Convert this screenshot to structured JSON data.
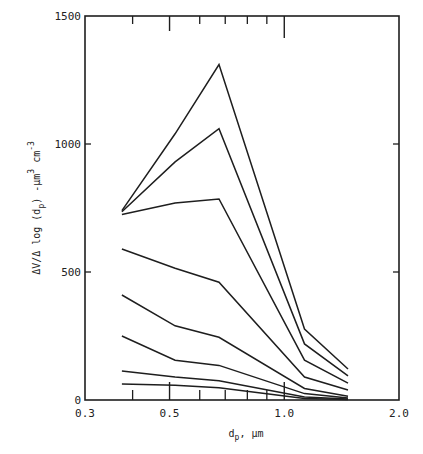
{
  "chart_data": {
    "type": "line",
    "title": "",
    "xlabel": "d_p, μm",
    "ylabel": "ΔV/Δlog(d_p)-μm³cm⁻³",
    "xscale": "log",
    "xlim": [
      0.3,
      2.0
    ],
    "ylim": [
      0,
      1500
    ],
    "x_ticks": [
      0.3,
      0.5,
      1.0,
      2.0
    ],
    "x_tick_labels": [
      "0.3",
      "0.5",
      "1.0",
      "2.0"
    ],
    "x_minor_ticks": [
      0.4,
      0.6,
      0.7,
      0.8,
      0.9
    ],
    "y_ticks": [
      0,
      500,
      1000,
      1500
    ],
    "y_tick_labels": [
      "0",
      "500",
      "1000",
      "1500"
    ],
    "grid": false,
    "legend": null,
    "x": [
      0.375,
      0.517,
      0.674,
      1.13,
      1.47
    ],
    "series": [
      {
        "name": "curve-1",
        "values": [
          740,
          1040,
          1310,
          277,
          121
        ]
      },
      {
        "name": "curve-2",
        "values": [
          735,
          930,
          1060,
          219,
          94
        ]
      },
      {
        "name": "curve-3",
        "values": [
          725,
          770,
          785,
          156,
          66
        ]
      },
      {
        "name": "curve-4",
        "values": [
          590,
          515,
          460,
          90,
          39
        ]
      },
      {
        "name": "curve-5",
        "values": [
          410,
          290,
          245,
          45,
          15
        ]
      },
      {
        "name": "curve-6",
        "values": [
          250,
          155,
          135,
          25,
          8
        ]
      },
      {
        "name": "curve-7",
        "values": [
          113,
          90,
          75,
          12,
          4
        ]
      },
      {
        "name": "curve-8",
        "values": [
          62,
          58,
          48,
          6,
          2
        ]
      }
    ]
  },
  "labels": {
    "x_axis_main": "d",
    "x_axis_sub": "p",
    "x_axis_unit": ", μm",
    "y_axis_pre": "ΔV/Δ log (d",
    "y_axis_sub": "p",
    "y_axis_mid": ") -μm",
    "y_axis_sup": "3",
    "y_axis_unit": " cm",
    "y_axis_sup2": "-3"
  },
  "colors": {
    "line": "#1e1e1e",
    "axis": "#1e1e1e",
    "background": "#ffffff"
  }
}
